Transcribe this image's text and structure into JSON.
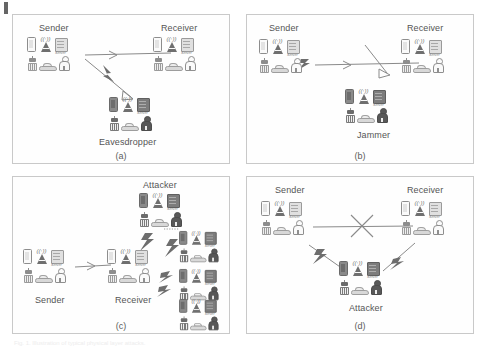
{
  "figure": {
    "caption": "Fig. 1. Illustration of typical physical layer attacks.",
    "panels": [
      {
        "id": "a",
        "caption": "(a)",
        "labels": [
          "Sender",
          "Receiver",
          "Eavesdropper"
        ],
        "nodes": [
          {
            "name": "Sender",
            "label": "Sender",
            "label_pos": "above",
            "style": "light"
          },
          {
            "name": "Receiver",
            "label": "Receiver",
            "label_pos": "above",
            "style": "light"
          },
          {
            "name": "Eavesdropper",
            "label": "Eavesdropper",
            "label_pos": "below",
            "style": "dark"
          }
        ],
        "links": [
          {
            "from": "Sender",
            "to": "Receiver",
            "type": "signal-arrow"
          },
          {
            "from": "Sender",
            "to": "Eavesdropper",
            "type": "lightning-arrow"
          }
        ]
      },
      {
        "id": "b",
        "caption": "(b)",
        "labels": [
          "Sender",
          "Receiver",
          "Jammer"
        ],
        "nodes": [
          {
            "name": "Sender",
            "label": "Sender",
            "label_pos": "above",
            "style": "light"
          },
          {
            "name": "Receiver",
            "label": "Receiver",
            "label_pos": "above",
            "style": "light"
          },
          {
            "name": "Jammer",
            "label": "Jammer",
            "label_pos": "below",
            "style": "dark"
          }
        ],
        "links": [
          {
            "from": "Sender",
            "to": "Receiver",
            "type": "signal-arrow"
          },
          {
            "from": "Jammer",
            "to": "link",
            "type": "jam-arrow"
          }
        ]
      },
      {
        "id": "c",
        "caption": "(c)",
        "labels": [
          "Sender",
          "Receiver",
          "Attacker"
        ],
        "nodes": [
          {
            "name": "Sender",
            "label": "Sender",
            "label_pos": "below",
            "style": "light"
          },
          {
            "name": "Receiver",
            "label": "Receiver",
            "label_pos": "below",
            "style": "light"
          },
          {
            "name": "Attacker",
            "label": "Attacker",
            "label_pos": "above",
            "style": "dark"
          },
          {
            "name": "Flood1",
            "label": "",
            "label_pos": "none",
            "style": "dark"
          },
          {
            "name": "Flood2",
            "label": "",
            "label_pos": "none",
            "style": "dark"
          },
          {
            "name": "Flood3",
            "label": "",
            "label_pos": "none",
            "style": "dark"
          }
        ],
        "links": [
          {
            "from": "Sender",
            "to": "Receiver",
            "type": "signal-arrow"
          },
          {
            "from": "Attacker",
            "to": "Receiver",
            "type": "lightning"
          },
          {
            "from": "Flood1",
            "to": "Receiver",
            "type": "lightning"
          },
          {
            "from": "Flood2",
            "to": "Receiver",
            "type": "lightning"
          },
          {
            "from": "Flood3",
            "to": "Receiver",
            "type": "lightning"
          }
        ],
        "continuation_marker": "dotted-line"
      },
      {
        "id": "d",
        "caption": "(d)",
        "labels": [
          "Sender",
          "Receiver",
          "Attacker"
        ],
        "nodes": [
          {
            "name": "Sender",
            "label": "Sender",
            "label_pos": "above",
            "style": "light"
          },
          {
            "name": "Receiver",
            "label": "Receiver",
            "label_pos": "above",
            "style": "light"
          },
          {
            "name": "Attacker",
            "label": "Attacker",
            "label_pos": "below",
            "style": "dark"
          }
        ],
        "links": [
          {
            "from": "Sender",
            "to": "Receiver",
            "type": "blocked-link",
            "marker": "x-cross"
          },
          {
            "from": "Sender",
            "to": "Attacker",
            "type": "lightning-arrow"
          },
          {
            "from": "Attacker",
            "to": "Receiver",
            "type": "lightning-arrow"
          }
        ]
      }
    ],
    "icon_set": [
      "phone-icon",
      "cell-tower-icon",
      "server-icon",
      "robot-icon",
      "car-icon",
      "person-icon"
    ],
    "server_tag": "Server",
    "colors": {
      "panel_border": "#c9c9c9",
      "light_node": "#8f8f8f",
      "dark_node": "#585858",
      "link": "#8a8a8a",
      "text": "#555555"
    }
  }
}
